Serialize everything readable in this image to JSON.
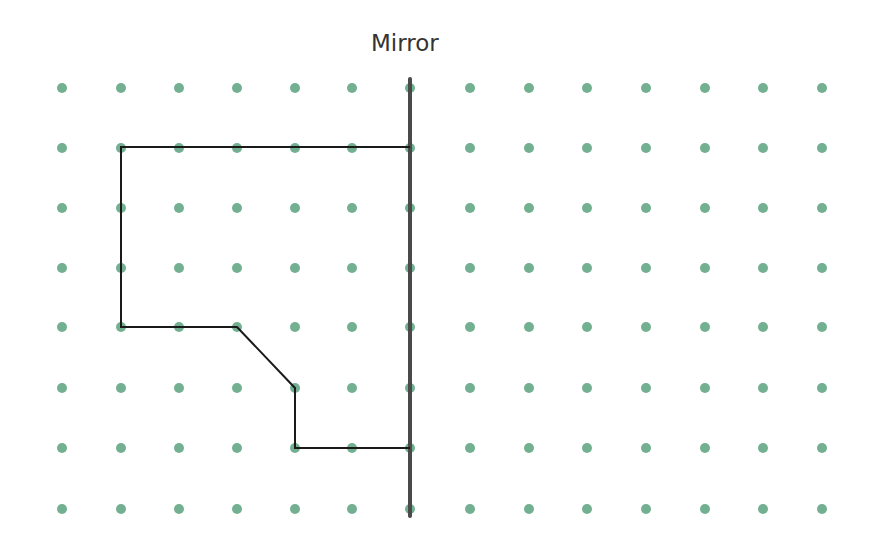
{
  "diagram": {
    "title": "Mirror",
    "colors": {
      "dot": "#72b091",
      "mirror": "#4a4a4a",
      "shape": "#1a1a1a",
      "title": "#333333"
    },
    "grid": {
      "columns_x": [
        62,
        121,
        179,
        237,
        295,
        352,
        410,
        470,
        529,
        587,
        646,
        705,
        763,
        822
      ],
      "rows_y": [
        88,
        148,
        208,
        268,
        327,
        388,
        448,
        509
      ],
      "dot_radius": 5
    },
    "mirror_line": {
      "x": 410,
      "y1": 79,
      "y2": 516,
      "width": 4
    },
    "shape_points": [
      [
        410,
        147
      ],
      [
        121,
        147
      ],
      [
        121,
        327
      ],
      [
        237,
        327
      ],
      [
        295,
        388
      ],
      [
        295,
        448
      ],
      [
        410,
        448
      ]
    ]
  }
}
